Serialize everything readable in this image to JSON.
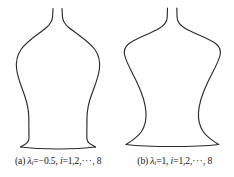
{
  "figure": {
    "type": "line-drawing-pair",
    "stroke_color": "#2b2b2b",
    "background_color": "#ffffff",
    "panels": [
      {
        "id": "a",
        "caption": {
          "tag": "(a)",
          "symbol": "λ",
          "subscript": "i",
          "equals_value": "=−0.5,",
          "index_symbol": "i",
          "index_range": "=1,2,",
          "dots": "···",
          "index_end": ", 8",
          "full_text": "(a) λᵢ=−0.5, i=1,2,···, 8"
        },
        "shape_name": "slender-shoulder-vase"
      },
      {
        "id": "b",
        "caption": {
          "tag": "(b)",
          "symbol": "λ",
          "subscript": "i",
          "equals_value": "=1,",
          "index_symbol": "i",
          "index_range": "=1,2,",
          "dots": "···",
          "index_end": ", 8",
          "full_text": "(b) λᵢ=1, i=1,2,···, 8"
        },
        "shape_name": "broad-shoulder-vase"
      }
    ]
  }
}
